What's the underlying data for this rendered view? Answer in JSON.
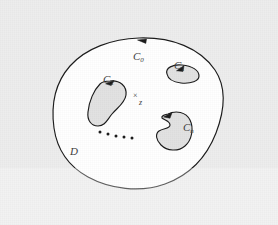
{
  "figure": {
    "caption_domain_label": "D",
    "background_color": "#ededed",
    "region_fill": "#ffffff",
    "hole_fill": "#e2e2e2",
    "stroke_color": "#1a1a1a",
    "label_color": "#3b3b3b"
  },
  "labels": {
    "outer_curve": {
      "base": "C",
      "sub": "0"
    },
    "hole_1": {
      "base": "C",
      "sub": "1"
    },
    "hole_2": {
      "base": "C",
      "sub": "2"
    },
    "hole_n": {
      "base": "C",
      "sub": "n"
    },
    "domain": "D",
    "point_marker": "×",
    "point_name": "z"
  },
  "ellipsis": {
    "dot_count": 5,
    "dots": [
      {
        "cx": 100,
        "cy": 132,
        "r": 1.5
      },
      {
        "cx": 108,
        "cy": 134,
        "r": 1.5
      },
      {
        "cx": 116,
        "cy": 136,
        "r": 1.5
      },
      {
        "cx": 124,
        "cy": 137,
        "r": 1.5
      },
      {
        "cx": 132,
        "cy": 138,
        "r": 1.5
      }
    ]
  },
  "curves": {
    "outer_boundary_C0": {
      "orientation": "counterclockwise",
      "arrow_at": {
        "x": 143,
        "y": 41,
        "direction": "left"
      }
    },
    "hole_C1": {
      "orientation": "clockwise",
      "arrow_at": {
        "x": 180,
        "y": 70,
        "direction": "up-right"
      }
    },
    "hole_C2": {
      "orientation": "clockwise",
      "arrow_at": {
        "x": 110,
        "y": 82,
        "direction": "right"
      }
    },
    "hole_Cn": {
      "orientation": "clockwise",
      "arrow_at": {
        "x": 168,
        "y": 115,
        "direction": "up-right"
      }
    }
  }
}
